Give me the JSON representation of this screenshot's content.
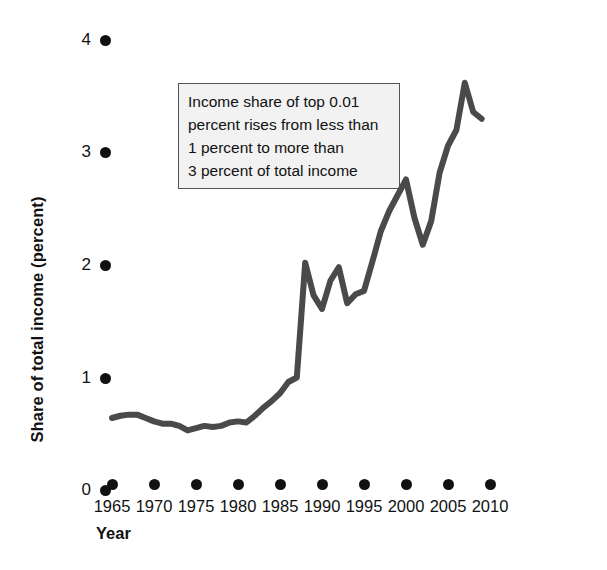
{
  "chart_data": {
    "type": "line",
    "title": "",
    "xlabel": "Year",
    "ylabel": "Share of total income (percent)",
    "xlim": [
      1965,
      2010
    ],
    "ylim": [
      0,
      4
    ],
    "grid": false,
    "legend": "none",
    "line_color": "#4a4a4a",
    "tick_color": "#111111",
    "x_ticks": [
      "1965",
      "1970",
      "1975",
      "1980",
      "1985",
      "1990",
      "1995",
      "2000",
      "2005",
      "2010"
    ],
    "y_ticks": [
      "0",
      "1",
      "2",
      "3",
      "4"
    ],
    "series": [
      {
        "name": "Income share of top 0.01 percent",
        "x": [
          1965,
          1966,
          1967,
          1968,
          1969,
          1970,
          1971,
          1972,
          1973,
          1974,
          1975,
          1976,
          1977,
          1978,
          1979,
          1980,
          1981,
          1982,
          1983,
          1984,
          1985,
          1986,
          1987,
          1988,
          1989,
          1990,
          1991,
          1992,
          1993,
          1994,
          1995,
          1996,
          1997,
          1998,
          1999,
          2000,
          2001,
          2002,
          2003,
          2004,
          2005,
          2006,
          2007,
          2008,
          2009
        ],
        "values": [
          0.64,
          0.66,
          0.67,
          0.67,
          0.64,
          0.61,
          0.59,
          0.59,
          0.57,
          0.53,
          0.55,
          0.57,
          0.56,
          0.57,
          0.6,
          0.61,
          0.6,
          0.66,
          0.73,
          0.79,
          0.86,
          0.96,
          1.0,
          2.02,
          1.73,
          1.61,
          1.86,
          1.98,
          1.66,
          1.74,
          1.77,
          2.03,
          2.3,
          2.48,
          2.62,
          2.76,
          2.42,
          2.18,
          2.39,
          2.82,
          3.06,
          3.2,
          3.62,
          3.36,
          3.3
        ]
      }
    ],
    "annotation": {
      "lines": [
        "Income share of top 0.01",
        "percent rises from less than",
        "1 percent to more than",
        "3 percent of total income"
      ]
    }
  }
}
